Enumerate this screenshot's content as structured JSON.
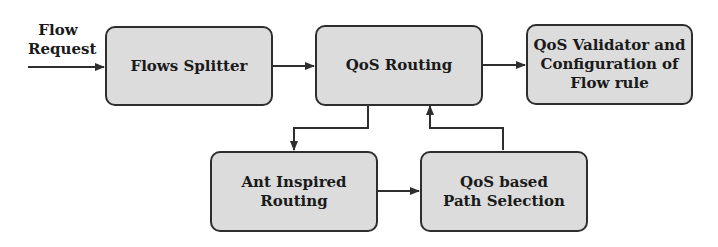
{
  "diagram": {
    "input_label": [
      "Flow",
      "Request"
    ],
    "nodes": [
      {
        "id": "flows-splitter",
        "lines": [
          "Flows Splitter"
        ]
      },
      {
        "id": "qos-routing",
        "lines": [
          "QoS Routing"
        ]
      },
      {
        "id": "qos-validator",
        "lines": [
          "QoS Validator and",
          "Configuration of",
          "Flow rule"
        ]
      },
      {
        "id": "ant-inspired-routing",
        "lines": [
          "Ant Inspired",
          "Routing"
        ]
      },
      {
        "id": "qos-path-selection",
        "lines": [
          "QoS based",
          "Path Selection"
        ]
      }
    ],
    "edges": [
      {
        "from": "input",
        "to": "flows-splitter"
      },
      {
        "from": "flows-splitter",
        "to": "qos-routing"
      },
      {
        "from": "qos-routing",
        "to": "qos-validator"
      },
      {
        "from": "qos-routing",
        "to": "ant-inspired-routing"
      },
      {
        "from": "ant-inspired-routing",
        "to": "qos-path-selection"
      },
      {
        "from": "qos-path-selection",
        "to": "qos-routing"
      }
    ],
    "colors": {
      "box_fill": "#dcdcdc",
      "stroke": "#2e2e2e",
      "text": "#1a1a1a"
    }
  }
}
